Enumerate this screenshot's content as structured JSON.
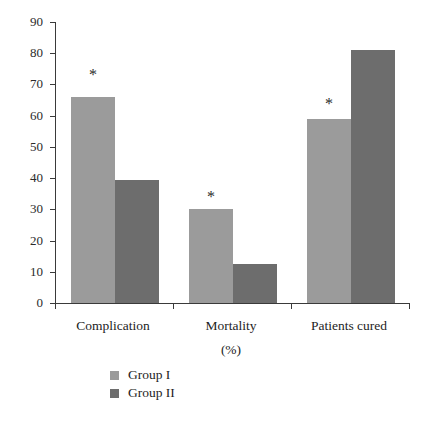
{
  "chart_data": {
    "type": "bar",
    "title": "",
    "subtitle": "",
    "xlabel": "",
    "ylabel": "",
    "unit_note": "(%)",
    "categories": [
      "Complication",
      "Mortality",
      "Patients cured"
    ],
    "series": [
      {
        "name": "Group I",
        "color": "#9b9b9b",
        "values": [
          66,
          30,
          59
        ]
      },
      {
        "name": "Group II",
        "color": "#6d6d6d",
        "values": [
          39.5,
          12.5,
          81
        ]
      }
    ],
    "ylim": [
      0,
      90
    ],
    "yticks": [
      0,
      10,
      20,
      30,
      40,
      50,
      60,
      70,
      80,
      90
    ],
    "ytick_labels": [
      "0",
      "10",
      "20",
      "30",
      "40",
      "50",
      "60",
      "70",
      "80",
      "90"
    ],
    "grid": false,
    "legend_position": "bottom-left",
    "annotations": [
      {
        "text": "*",
        "category": "Complication",
        "series": "Group I"
      },
      {
        "text": "*",
        "category": "Mortality",
        "series": "Group I"
      },
      {
        "text": "*",
        "category": "Patients cured",
        "series": "Group I"
      }
    ],
    "axis_color": "#3a3a3a"
  },
  "yticks": {
    "t0": "0",
    "t1": "10",
    "t2": "20",
    "t3": "30",
    "t4": "40",
    "t5": "50",
    "t6": "60",
    "t7": "70",
    "t8": "80",
    "t9": "90"
  },
  "categories": {
    "c0": "Complication",
    "c1": "Mortality",
    "c1_sub": "(%)",
    "c2": "Patients cured"
  },
  "legend": {
    "item0": "Group I",
    "item1": "Group II"
  },
  "stars": {
    "s0": "*",
    "s1": "*",
    "s2": "*"
  }
}
